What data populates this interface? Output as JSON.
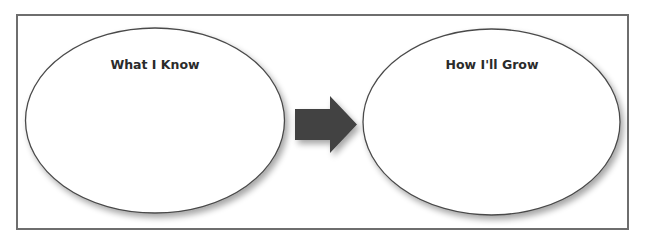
{
  "diagram": {
    "type": "graphic-organizer",
    "nodes": [
      {
        "id": "what-i-know",
        "label": "What I Know",
        "shape": "ellipse"
      },
      {
        "id": "how-ill-grow",
        "label": "How I'll Grow",
        "shape": "ellipse"
      }
    ],
    "edges": [
      {
        "from": "what-i-know",
        "to": "how-ill-grow",
        "style": "block-arrow"
      }
    ],
    "colors": {
      "frame_border": "#6e6e6e",
      "ellipse_stroke": "#4a4a4a",
      "arrow_fill": "#434343",
      "label_text": "#2b2b2b",
      "background": "#ffffff"
    }
  }
}
